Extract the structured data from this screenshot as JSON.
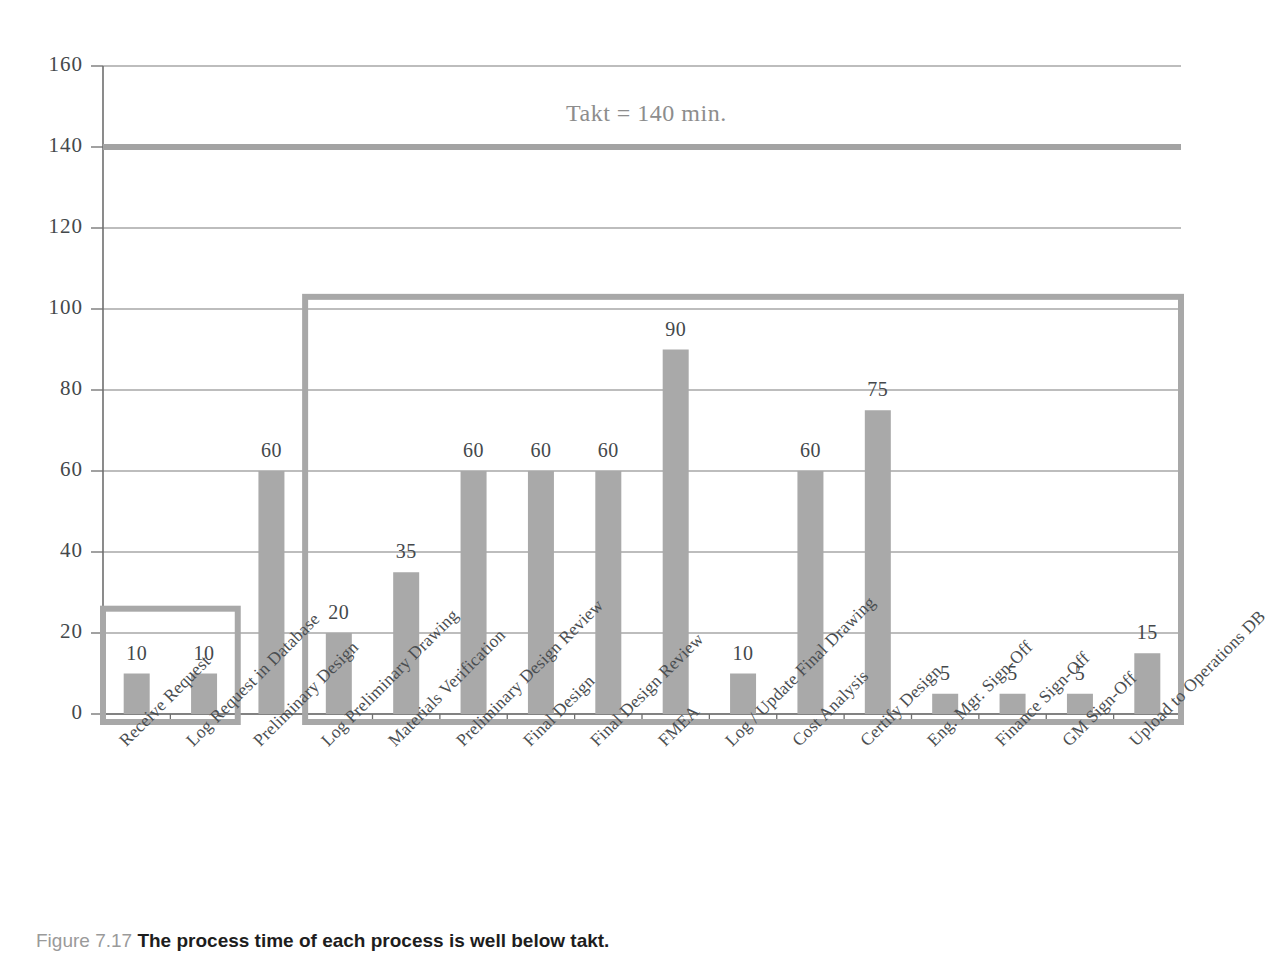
{
  "caption": {
    "figure_number": "Figure 7.17",
    "text": "The process time of each process is well below takt."
  },
  "chart_data": {
    "type": "bar",
    "title": "",
    "subtitle": "",
    "xlabel": "",
    "ylabel": "",
    "ylim": [
      0,
      160
    ],
    "yticks": [
      0,
      20,
      40,
      60,
      80,
      100,
      120,
      140,
      160
    ],
    "ytick_labels": [
      "0",
      "20",
      "40",
      "60",
      "80",
      "100",
      "120",
      "140",
      "160"
    ],
    "grid": true,
    "legend": "none",
    "bar_color": "#a9a9a9",
    "gridline_color": "#7d7d7d",
    "categories": [
      "Receive Request",
      "Log Request in Database",
      "Preliminary Design",
      "Log Preliminary Drawing",
      "Materials Verification",
      "Preliminary Design Review",
      "Final Design",
      "Final Design Review",
      "FMEA",
      "Log / Update Final Drawing",
      "Cost Analysis",
      "Certify Design",
      "Eng. Mgr. Sign-Off",
      "Finance Sign-Off",
      "GM Sign-Off",
      "Upload to Operations DB"
    ],
    "values": [
      10,
      10,
      60,
      20,
      35,
      60,
      60,
      60,
      90,
      10,
      60,
      75,
      5,
      5,
      5,
      15
    ],
    "value_labels": [
      "10",
      "10",
      "60",
      "20",
      "35",
      "60",
      "60",
      "60",
      "90",
      "10",
      "60",
      "75",
      "5",
      "5",
      "5",
      "15"
    ],
    "annotations": [
      {
        "name": "takt-line",
        "label": "Takt = 140 min.",
        "value": 140,
        "type": "horizontal-reference-line",
        "color": "#a3a3a3"
      },
      {
        "name": "highlight-box-left",
        "type": "rectangle",
        "color": "#a8a8a8",
        "covers_categories": [
          "Receive Request",
          "Log Request in Database"
        ],
        "top_value": 26,
        "bottom_value": 0
      },
      {
        "name": "highlight-box-right",
        "type": "rectangle",
        "color": "#a8a8a8",
        "covers_categories": [
          "Log Preliminary Drawing",
          "Materials Verification",
          "Preliminary Design Review",
          "Final Design",
          "Final Design Review",
          "FMEA",
          "Log / Update Final Drawing",
          "Cost Analysis",
          "Certify Design",
          "Eng. Mgr. Sign-Off",
          "Finance Sign-Off",
          "GM Sign-Off",
          "Upload to Operations DB"
        ],
        "top_value": 103,
        "bottom_value": 0
      }
    ]
  }
}
